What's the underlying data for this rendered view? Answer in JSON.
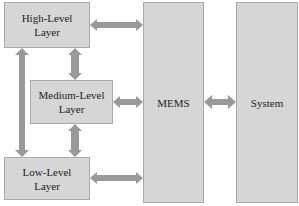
{
  "diagram": {
    "nodes": {
      "high": "High-Level\nLayer",
      "medium": "Medium-Level\nLayer",
      "low": "Low-Level\nLayer",
      "mems": "MEMS",
      "system": "System"
    },
    "colors": {
      "box_fill": "#d6d6d6",
      "box_border": "#a9a9a9",
      "arrow": "#999999"
    },
    "edges": [
      {
        "from": "high",
        "to": "mems",
        "type": "bidirectional"
      },
      {
        "from": "medium",
        "to": "mems",
        "type": "bidirectional"
      },
      {
        "from": "low",
        "to": "mems",
        "type": "bidirectional"
      },
      {
        "from": "high",
        "to": "medium",
        "type": "bidirectional"
      },
      {
        "from": "medium",
        "to": "low",
        "type": "bidirectional"
      },
      {
        "from": "high",
        "to": "low",
        "type": "bidirectional"
      },
      {
        "from": "mems",
        "to": "system",
        "type": "bidirectional"
      }
    ]
  }
}
